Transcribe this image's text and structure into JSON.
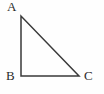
{
  "figure": {
    "name": "right-triangle-ABC",
    "background_color": "#fefefe",
    "stroke_color": "#3a3a3a",
    "label_color": "#2b2b2b",
    "stroke_width": 1.5
  },
  "labels": {
    "a": "A",
    "b": "B",
    "c": "C"
  },
  "diagram_data": {
    "type": "geometry",
    "shape": "right triangle",
    "right_angle_at": "B",
    "vertices": [
      {
        "name": "A",
        "x": 21,
        "y": 16,
        "label_position": "above-left"
      },
      {
        "name": "B",
        "x": 21,
        "y": 76,
        "label_position": "left"
      },
      {
        "name": "C",
        "x": 79,
        "y": 76,
        "label_position": "right"
      }
    ],
    "edges": [
      {
        "from": "A",
        "to": "B",
        "role": "vertical leg"
      },
      {
        "from": "B",
        "to": "C",
        "role": "horizontal leg"
      },
      {
        "from": "C",
        "to": "A",
        "role": "hypotenuse"
      }
    ]
  }
}
